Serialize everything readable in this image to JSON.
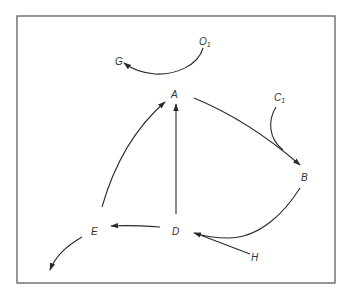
{
  "diagram": {
    "type": "directed-graph",
    "frame": {
      "x": 17,
      "y": 16,
      "width": 318,
      "height": 267
    },
    "colors": {
      "line": "#2a2a2a",
      "frame": "#6a6a6a",
      "text": "#333333",
      "background": "#ffffff"
    },
    "nodes": {
      "O1": {
        "label": "O",
        "subscript": "1"
      },
      "G": {
        "label": "G"
      },
      "A": {
        "label": "A"
      },
      "C1": {
        "label": "C",
        "subscript": "1"
      },
      "B": {
        "label": "B"
      },
      "D": {
        "label": "D"
      },
      "E": {
        "label": "E"
      },
      "H": {
        "label": "H"
      }
    },
    "edges": [
      {
        "from": "O1",
        "to": "G",
        "style": "curved"
      },
      {
        "from": "E",
        "to": "A",
        "style": "curved"
      },
      {
        "from": "D",
        "to": "A",
        "style": "straight"
      },
      {
        "from": "A",
        "to": "B",
        "style": "curved"
      },
      {
        "from": "C1",
        "to": "B",
        "style": "curved-merge"
      },
      {
        "from": "B",
        "to": "D",
        "style": "curved"
      },
      {
        "from": "H",
        "to": "D",
        "style": "straight"
      },
      {
        "from": "D",
        "to": "E",
        "style": "straight"
      },
      {
        "from": "E",
        "to": "out",
        "style": "curved"
      }
    ]
  }
}
